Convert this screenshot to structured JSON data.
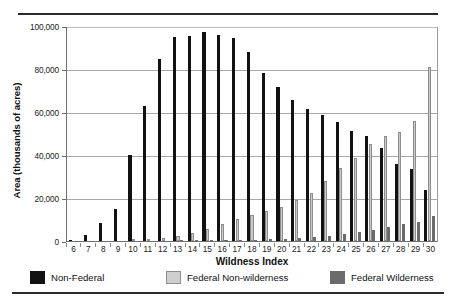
{
  "chart_data": {
    "type": "bar",
    "title": "",
    "xlabel": "Wildness Index",
    "ylabel": "Area (thousands of acres)",
    "ylim": [
      0,
      100000
    ],
    "ytick_labels": [
      "0",
      "20,000",
      "40,000",
      "60,000",
      "80,000",
      "100,000"
    ],
    "ytick_values": [
      0,
      20000,
      40000,
      60000,
      80000,
      100000
    ],
    "grid": true,
    "legend_position": "bottom",
    "categories": [
      "6",
      "7",
      "8",
      "9",
      "10",
      "11",
      "12",
      "13",
      "14",
      "15",
      "16",
      "17",
      "18",
      "19",
      "20",
      "21",
      "22",
      "23",
      "24",
      "25",
      "26",
      "27",
      "28",
      "29",
      "30"
    ],
    "series": [
      {
        "name": "Non-Federal",
        "color": "#121212",
        "values": [
          300,
          2800,
          8300,
          15000,
          40200,
          63000,
          84700,
          94700,
          95400,
          97200,
          95700,
          94300,
          87700,
          78000,
          71600,
          65400,
          61300,
          58400,
          55300,
          51000,
          49000,
          43400,
          36000,
          33700,
          23500
        ]
      },
      {
        "name": "Federal Non-wilderness",
        "color": "#c9c9c9",
        "values": [
          0,
          0,
          0,
          0,
          300,
          900,
          1500,
          2300,
          3500,
          5500,
          8000,
          10200,
          12300,
          14000,
          15600,
          19000,
          22500,
          28000,
          34000,
          38800,
          45200,
          48700,
          50800,
          55700,
          81000
        ]
      },
      {
        "name": "Federal Wilderness",
        "color": "#6b6b6b",
        "values": [
          0,
          0,
          0,
          0,
          0,
          0,
          0,
          200,
          200,
          300,
          400,
          500,
          700,
          900,
          1000,
          1500,
          1900,
          2400,
          3100,
          4000,
          5100,
          6700,
          8000,
          9000,
          11600
        ]
      }
    ]
  },
  "legend": {
    "items": [
      {
        "label": "Non-Federal",
        "swatch": "black-square-icon"
      },
      {
        "label": "Federal Non-wilderness",
        "swatch": "light-gray-square-icon"
      },
      {
        "label": "Federal Wilderness",
        "swatch": "dark-gray-square-icon"
      }
    ]
  }
}
